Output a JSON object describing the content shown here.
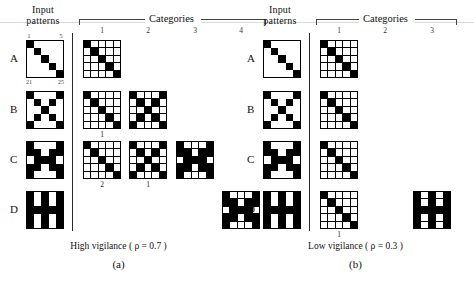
{
  "figure": {
    "panels": [
      {
        "id": "a",
        "letter": "(a)",
        "caption": "High vigilance ( ρ = 0.7 )",
        "input_header_line1": "Input",
        "input_header_line2": "patterns",
        "categories_header": "Categories",
        "category_numbers": [
          "1",
          "2",
          "3",
          "4"
        ],
        "grid_ticks": {
          "top_left": "1",
          "top_right": "5",
          "bottom_left": "21",
          "bottom_right": "25"
        },
        "rows": [
          {
            "label": "A",
            "input_pattern": [
              [
                1,
                0,
                0,
                0,
                0
              ],
              [
                0,
                1,
                0,
                0,
                0
              ],
              [
                0,
                0,
                1,
                0,
                0
              ],
              [
                0,
                0,
                0,
                1,
                0
              ],
              [
                0,
                0,
                0,
                0,
                1
              ]
            ],
            "categories": [
              {
                "column": 1,
                "sub_number": "",
                "pattern": [
                  [
                    1,
                    0,
                    0,
                    0,
                    0
                  ],
                  [
                    0,
                    1,
                    0,
                    0,
                    0
                  ],
                  [
                    0,
                    0,
                    1,
                    0,
                    0
                  ],
                  [
                    0,
                    0,
                    0,
                    1,
                    0
                  ],
                  [
                    0,
                    0,
                    0,
                    0,
                    1
                  ]
                ]
              }
            ]
          },
          {
            "label": "B",
            "input_pattern": [
              [
                1,
                0,
                0,
                0,
                1
              ],
              [
                0,
                1,
                0,
                1,
                0
              ],
              [
                0,
                0,
                1,
                0,
                0
              ],
              [
                0,
                1,
                0,
                1,
                0
              ],
              [
                1,
                0,
                0,
                0,
                1
              ]
            ],
            "categories": [
              {
                "column": 1,
                "sub_number": "1",
                "pattern": [
                  [
                    1,
                    0,
                    0,
                    0,
                    0
                  ],
                  [
                    0,
                    1,
                    0,
                    0,
                    0
                  ],
                  [
                    0,
                    0,
                    1,
                    0,
                    0
                  ],
                  [
                    0,
                    0,
                    0,
                    1,
                    0
                  ],
                  [
                    0,
                    0,
                    0,
                    0,
                    1
                  ]
                ]
              },
              {
                "column": 2,
                "sub_number": "",
                "pattern": [
                  [
                    1,
                    0,
                    0,
                    0,
                    1
                  ],
                  [
                    0,
                    1,
                    0,
                    1,
                    0
                  ],
                  [
                    0,
                    0,
                    1,
                    0,
                    0
                  ],
                  [
                    0,
                    1,
                    0,
                    1,
                    0
                  ],
                  [
                    1,
                    0,
                    0,
                    0,
                    1
                  ]
                ]
              }
            ]
          },
          {
            "label": "C",
            "input_pattern": [
              [
                1,
                0,
                0,
                0,
                1
              ],
              [
                1,
                1,
                0,
                1,
                1
              ],
              [
                0,
                1,
                1,
                1,
                0
              ],
              [
                1,
                1,
                0,
                1,
                1
              ],
              [
                1,
                0,
                0,
                0,
                1
              ]
            ],
            "categories": [
              {
                "column": 1,
                "sub_number": "2",
                "pattern": [
                  [
                    1,
                    0,
                    0,
                    0,
                    0
                  ],
                  [
                    0,
                    1,
                    0,
                    0,
                    0
                  ],
                  [
                    0,
                    0,
                    1,
                    0,
                    0
                  ],
                  [
                    0,
                    0,
                    0,
                    1,
                    0
                  ],
                  [
                    0,
                    0,
                    0,
                    0,
                    1
                  ]
                ]
              },
              {
                "column": 2,
                "sub_number": "1",
                "pattern": [
                  [
                    1,
                    0,
                    0,
                    0,
                    1
                  ],
                  [
                    0,
                    1,
                    0,
                    1,
                    0
                  ],
                  [
                    0,
                    0,
                    1,
                    0,
                    0
                  ],
                  [
                    0,
                    1,
                    0,
                    1,
                    0
                  ],
                  [
                    1,
                    0,
                    0,
                    0,
                    1
                  ]
                ]
              },
              {
                "column": 3,
                "sub_number": "",
                "pattern": [
                  [
                    1,
                    0,
                    0,
                    0,
                    1
                  ],
                  [
                    1,
                    1,
                    0,
                    1,
                    1
                  ],
                  [
                    0,
                    1,
                    1,
                    1,
                    0
                  ],
                  [
                    1,
                    1,
                    0,
                    1,
                    1
                  ],
                  [
                    1,
                    0,
                    0,
                    0,
                    1
                  ]
                ]
              }
            ]
          },
          {
            "label": "D",
            "input_pattern": [
              [
                1,
                0,
                1,
                0,
                1
              ],
              [
                1,
                0,
                1,
                0,
                1
              ],
              [
                1,
                1,
                1,
                1,
                1
              ],
              [
                1,
                0,
                1,
                0,
                1
              ],
              [
                1,
                0,
                1,
                0,
                1
              ]
            ],
            "categories": [
              {
                "column": 4,
                "sub_number": "",
                "pattern": [
                  [
                    1,
                    0,
                    0,
                    0,
                    1
                  ],
                  [
                    1,
                    1,
                    0,
                    1,
                    1
                  ],
                  [
                    0,
                    1,
                    1,
                    1,
                    0
                  ],
                  [
                    1,
                    1,
                    0,
                    1,
                    1
                  ],
                  [
                    1,
                    0,
                    0,
                    0,
                    1
                  ]
                ]
              }
            ]
          }
        ]
      },
      {
        "id": "b",
        "letter": "(b)",
        "caption": "Low vigilance ( ρ = 0.3 )",
        "input_header_line1": "Input",
        "input_header_line2": "patterns",
        "categories_header": "Categories",
        "category_numbers": [
          "1",
          "2",
          "3"
        ],
        "grid_ticks": {
          "top_left": "",
          "top_right": "",
          "bottom_left": "",
          "bottom_right": ""
        },
        "rows": [
          {
            "label": "A",
            "input_pattern": [
              [
                1,
                0,
                0,
                0,
                0
              ],
              [
                0,
                1,
                0,
                0,
                0
              ],
              [
                0,
                0,
                1,
                0,
                0
              ],
              [
                0,
                0,
                0,
                1,
                0
              ],
              [
                0,
                0,
                0,
                0,
                1
              ]
            ],
            "categories": [
              {
                "column": 1,
                "sub_number": "",
                "pattern": [
                  [
                    1,
                    0,
                    0,
                    0,
                    0
                  ],
                  [
                    0,
                    1,
                    0,
                    0,
                    0
                  ],
                  [
                    0,
                    0,
                    1,
                    0,
                    0
                  ],
                  [
                    0,
                    0,
                    0,
                    1,
                    0
                  ],
                  [
                    0,
                    0,
                    0,
                    0,
                    1
                  ]
                ]
              }
            ]
          },
          {
            "label": "B",
            "input_pattern": [
              [
                1,
                0,
                0,
                0,
                1
              ],
              [
                0,
                1,
                0,
                1,
                0
              ],
              [
                0,
                0,
                1,
                0,
                0
              ],
              [
                0,
                1,
                0,
                1,
                0
              ],
              [
                1,
                0,
                0,
                0,
                1
              ]
            ],
            "categories": [
              {
                "column": 1,
                "sub_number": "",
                "pattern": [
                  [
                    1,
                    0,
                    0,
                    0,
                    0
                  ],
                  [
                    0,
                    1,
                    0,
                    0,
                    0
                  ],
                  [
                    0,
                    0,
                    1,
                    0,
                    0
                  ],
                  [
                    0,
                    0,
                    0,
                    1,
                    0
                  ],
                  [
                    0,
                    0,
                    0,
                    0,
                    1
                  ]
                ]
              }
            ]
          },
          {
            "label": "C",
            "input_pattern": [
              [
                1,
                0,
                0,
                0,
                1
              ],
              [
                1,
                1,
                0,
                1,
                1
              ],
              [
                0,
                1,
                1,
                1,
                0
              ],
              [
                1,
                1,
                0,
                1,
                1
              ],
              [
                1,
                0,
                0,
                0,
                1
              ]
            ],
            "categories": [
              {
                "column": 1,
                "sub_number": "",
                "pattern": [
                  [
                    1,
                    0,
                    0,
                    0,
                    0
                  ],
                  [
                    0,
                    1,
                    0,
                    0,
                    0
                  ],
                  [
                    0,
                    0,
                    1,
                    0,
                    0
                  ],
                  [
                    0,
                    0,
                    0,
                    1,
                    0
                  ],
                  [
                    0,
                    0,
                    0,
                    0,
                    1
                  ]
                ]
              }
            ]
          },
          {
            "label": "D",
            "input_pattern": [
              [
                1,
                0,
                1,
                0,
                1
              ],
              [
                1,
                0,
                1,
                0,
                1
              ],
              [
                1,
                1,
                1,
                1,
                1
              ],
              [
                1,
                0,
                1,
                0,
                1
              ],
              [
                1,
                0,
                1,
                0,
                1
              ]
            ],
            "categories": [
              {
                "column": 1,
                "sub_number": "1",
                "pattern": [
                  [
                    1,
                    0,
                    0,
                    0,
                    0
                  ],
                  [
                    0,
                    1,
                    0,
                    0,
                    0
                  ],
                  [
                    0,
                    0,
                    1,
                    0,
                    0
                  ],
                  [
                    0,
                    0,
                    0,
                    1,
                    0
                  ],
                  [
                    0,
                    0,
                    0,
                    0,
                    1
                  ]
                ]
              },
              {
                "column": 3,
                "sub_number": "",
                "pattern": [
                  [
                    1,
                    0,
                    1,
                    0,
                    1
                  ],
                  [
                    1,
                    0,
                    1,
                    0,
                    1
                  ],
                  [
                    1,
                    1,
                    1,
                    1,
                    1
                  ],
                  [
                    1,
                    0,
                    1,
                    0,
                    1
                  ],
                  [
                    1,
                    0,
                    1,
                    0,
                    1
                  ]
                ]
              }
            ]
          }
        ]
      }
    ]
  }
}
